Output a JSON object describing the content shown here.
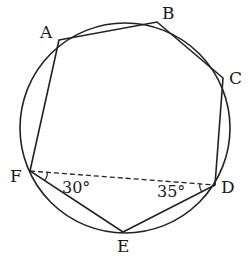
{
  "diagram": {
    "type": "geometry",
    "circle": {
      "cx": 125,
      "cy": 128,
      "r": 105
    },
    "vertices": {
      "A": {
        "label": "A",
        "x": 59,
        "y": 40,
        "lx": 40,
        "ly": 38
      },
      "B": {
        "label": "B",
        "x": 157,
        "y": 22,
        "lx": 162,
        "ly": 19
      },
      "C": {
        "label": "C",
        "x": 223,
        "y": 78,
        "lx": 229,
        "ly": 84
      },
      "D": {
        "label": "D",
        "x": 215,
        "y": 185,
        "lx": 221,
        "ly": 193
      },
      "E": {
        "label": "E",
        "x": 123,
        "y": 232,
        "lx": 118,
        "ly": 251
      },
      "F": {
        "label": "F",
        "x": 30,
        "y": 171,
        "lx": 10,
        "ly": 182
      }
    },
    "angles": {
      "DFE": {
        "label": "30°",
        "x": 62,
        "y": 193
      },
      "FDE": {
        "label": "35°",
        "x": 156,
        "y": 197
      }
    },
    "dashed_segment": "FD",
    "colors": {
      "stroke": "#222222",
      "background": "#ffffff"
    }
  }
}
